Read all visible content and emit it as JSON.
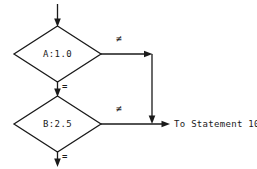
{
  "diagram": {
    "background_color": "#ffffff",
    "line_color": "#1a1a1a",
    "nodes": [
      {
        "id": "decision-a",
        "shape": "diamond",
        "label": "A:1.0"
      },
      {
        "id": "decision-b",
        "shape": "diamond",
        "label": "B:2.5"
      }
    ],
    "edge_labels": {
      "a_not_equal": "≠",
      "a_equal": "=",
      "b_not_equal": "≠",
      "b_equal": "="
    },
    "terminal": {
      "id": "to-statement-10",
      "label": "To Statement 10"
    },
    "entry": {
      "id": "entry-arrow",
      "label": ""
    }
  }
}
